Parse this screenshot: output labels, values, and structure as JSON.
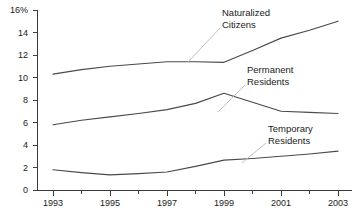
{
  "chart_data": {
    "type": "line",
    "title": "",
    "xlabel": "",
    "ylabel": "",
    "x": [
      1993,
      1994,
      1995,
      1996,
      1997,
      1998,
      1999,
      2000,
      2001,
      2002,
      2003
    ],
    "xlim": [
      1993,
      2003
    ],
    "ylim": [
      0,
      16
    ],
    "grid": false,
    "legend_position": "inline-annotations",
    "y_tick_labels": [
      "0",
      "2",
      "4",
      "6",
      "8",
      "10",
      "12",
      "14",
      "16%"
    ],
    "y_tick_values": [
      0,
      2,
      4,
      6,
      8,
      10,
      12,
      14,
      16
    ],
    "x_tick_labels": [
      "1993",
      "1995",
      "1997",
      "1999",
      "2001",
      "2003"
    ],
    "x_tick_values": [
      1993,
      1995,
      1997,
      1999,
      2001,
      2003
    ],
    "x_minor_tick_values": [
      1994,
      1996,
      1998,
      2000,
      2002
    ],
    "series": [
      {
        "name": "Naturalized Citizens",
        "values": [
          10.3,
          10.7,
          11.0,
          11.2,
          11.4,
          11.4,
          11.35,
          12.4,
          13.5,
          14.2,
          15.0
        ]
      },
      {
        "name": "Permanent Residents",
        "values": [
          5.8,
          6.2,
          6.5,
          6.8,
          7.15,
          7.7,
          8.6,
          7.8,
          7.0,
          6.9,
          6.8
        ]
      },
      {
        "name": "Temporary Residents",
        "values": [
          1.8,
          1.55,
          1.35,
          1.45,
          1.6,
          2.1,
          2.65,
          2.8,
          3.0,
          3.2,
          3.45
        ]
      }
    ],
    "annotations": [
      {
        "label_line_1": "Naturalized",
        "label_line_2": "Citizens",
        "target_series": "Naturalized Citizens"
      },
      {
        "label_line_1": "Permanent",
        "label_line_2": "Residents",
        "target_series": "Permanent Residents"
      },
      {
        "label_line_1": "Temporary",
        "label_line_2": "Residents",
        "target_series": "Temporary Residents"
      }
    ],
    "colors": {
      "line": "#4a4a4a",
      "axis": "#3a3a3a",
      "leader": "#b8b8b8",
      "text": "#1a1a1a",
      "background": "#ffffff"
    }
  }
}
